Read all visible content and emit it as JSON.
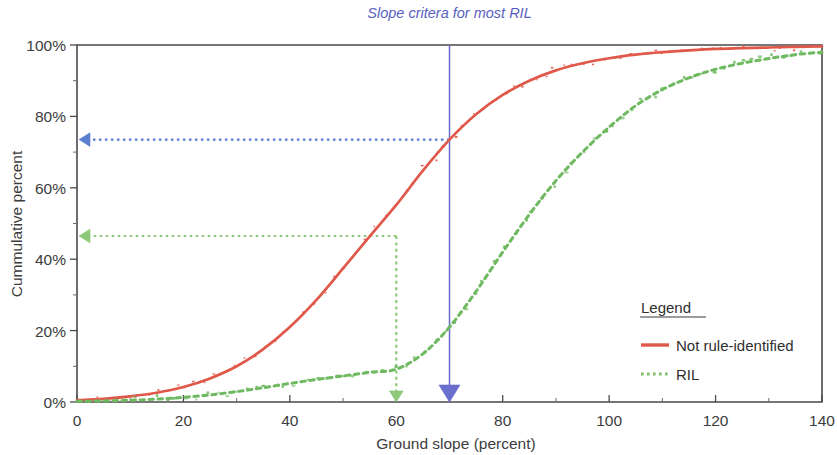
{
  "chart_data": {
    "type": "line",
    "title": "",
    "xlabel": "Ground slope (percent)",
    "ylabel": "Cummulative percent",
    "xlim": [
      0,
      140
    ],
    "ylim": [
      0,
      100
    ],
    "xticks": [
      0,
      20,
      40,
      60,
      80,
      100,
      120,
      140
    ],
    "xticklabels": [
      "0",
      "20",
      "40",
      "60",
      "80",
      "100",
      "120",
      "140"
    ],
    "yticks": [
      0,
      20,
      40,
      60,
      80,
      100
    ],
    "yticklabels": [
      "0%",
      "20%",
      "40%",
      "60%",
      "80%",
      "100%"
    ],
    "grid": false,
    "legend_position": "inside-lower-right",
    "legend_title": "Legend",
    "series": [
      {
        "name": "Not rule-identified",
        "style": "solid",
        "color": "#E0584A",
        "x": [
          0,
          5,
          10,
          15,
          20,
          25,
          30,
          35,
          40,
          45,
          50,
          55,
          60,
          65,
          70,
          75,
          80,
          85,
          90,
          95,
          100,
          105,
          110,
          115,
          120,
          125,
          130,
          135,
          140
        ],
        "y": [
          0.5,
          0.9,
          1.6,
          2.6,
          4.2,
          6.6,
          10.0,
          14.8,
          21.0,
          28.6,
          37.4,
          46.4,
          55.2,
          64.8,
          73.5,
          80.6,
          86.0,
          90.0,
          92.9,
          94.9,
          96.3,
          97.3,
          98.0,
          98.5,
          98.9,
          99.1,
          99.3,
          99.5,
          99.6
        ]
      },
      {
        "name": "RIL",
        "style": "dotted",
        "color": "#6FB961",
        "x": [
          0,
          5,
          10,
          15,
          20,
          25,
          30,
          35,
          40,
          45,
          50,
          55,
          60,
          65,
          70,
          75,
          80,
          85,
          90,
          95,
          100,
          105,
          110,
          115,
          120,
          125,
          130,
          135,
          140
        ],
        "y": [
          0.2,
          0.3,
          0.5,
          0.8,
          1.3,
          2.0,
          2.9,
          4.0,
          5.2,
          6.3,
          7.3,
          8.3,
          9.2,
          13.5,
          21.0,
          31.0,
          42.0,
          52.5,
          62.0,
          70.0,
          77.0,
          83.0,
          87.5,
          90.8,
          93.2,
          94.9,
          96.2,
          97.3,
          98.0
        ]
      }
    ],
    "annotations": [
      {
        "name": "slope-criteria-callout",
        "text": "Slope critera for most RIL",
        "color": "#5A5FC0",
        "x": 70
      },
      {
        "name": "blue-vertical-reference",
        "type": "vline-arrow",
        "color": "#6A6ECC",
        "x": 70,
        "from_y": 100,
        "to_y": 0
      },
      {
        "name": "blue-horizontal-reference",
        "type": "hline-arrow",
        "color": "#5A7FD0",
        "y": 73.5,
        "from_x": 70,
        "to_x": 0
      },
      {
        "name": "green-vertical-reference",
        "type": "vline-arrow",
        "color": "#8CC878",
        "x": 60,
        "from_y": 46.5,
        "to_y": 0
      },
      {
        "name": "green-horizontal-reference",
        "type": "hline-arrow",
        "color": "#8CC878",
        "y": 46.5,
        "from_x": 60,
        "to_x": 0
      }
    ]
  },
  "axes": {
    "x_title": "Ground slope (percent)",
    "y_title": "Cummulative percent",
    "x_labels": [
      "0",
      "20",
      "40",
      "60",
      "80",
      "100",
      "120",
      "140"
    ],
    "y_labels": [
      "0%",
      "20%",
      "40%",
      "60%",
      "80%",
      "100%"
    ]
  },
  "callout": {
    "text": "Slope critera for most RIL"
  },
  "legend": {
    "title": "Legend",
    "items": [
      {
        "label": "Not rule-identified",
        "color": "#E0584A",
        "style": "solid"
      },
      {
        "label": "RIL",
        "color": "#7FBF6B",
        "style": "dotted"
      }
    ]
  }
}
